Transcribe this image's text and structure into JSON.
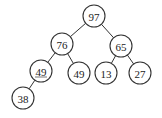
{
  "diagram": {
    "type": "binary-tree",
    "nodes": [
      {
        "id": "n97",
        "label": "97",
        "x": 94,
        "y": 16,
        "underline": false
      },
      {
        "id": "n76",
        "label": "76",
        "x": 62,
        "y": 44,
        "underline": false
      },
      {
        "id": "n65",
        "label": "65",
        "x": 121,
        "y": 46,
        "underline": false
      },
      {
        "id": "n49a",
        "label": "49",
        "x": 41,
        "y": 71,
        "underline": true
      },
      {
        "id": "n49b",
        "label": "49",
        "x": 79,
        "y": 73,
        "underline": false
      },
      {
        "id": "n13",
        "label": "13",
        "x": 106,
        "y": 73,
        "underline": false
      },
      {
        "id": "n27",
        "label": "27",
        "x": 140,
        "y": 73,
        "underline": false
      },
      {
        "id": "n38",
        "label": "38",
        "x": 23,
        "y": 98,
        "underline": false
      }
    ],
    "edges": [
      {
        "from": "n97",
        "to": "n76"
      },
      {
        "from": "n97",
        "to": "n65"
      },
      {
        "from": "n76",
        "to": "n49a"
      },
      {
        "from": "n76",
        "to": "n49b"
      },
      {
        "from": "n65",
        "to": "n13"
      },
      {
        "from": "n65",
        "to": "n27"
      },
      {
        "from": "n49a",
        "to": "n38"
      }
    ],
    "radius": 11
  }
}
